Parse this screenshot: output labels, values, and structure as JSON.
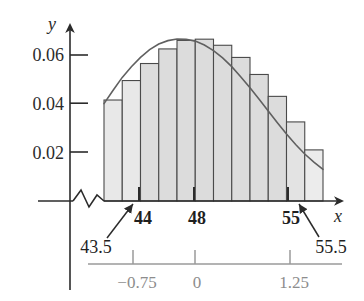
{
  "chart_data": {
    "type": "bar",
    "title": "",
    "xlabel": "x",
    "ylabel": "y",
    "grid": false,
    "legend": "none",
    "axis_break": true,
    "y_axis": {
      "ticks": [
        0.02,
        0.04,
        0.06
      ],
      "tick_labels": [
        "0.02",
        "0.04",
        "0.06"
      ],
      "ylim": [
        0,
        0.072
      ],
      "name": "y"
    },
    "x_axis": {
      "name": "x",
      "ticks": [
        44,
        48,
        55
      ],
      "tick_labels": [
        "44",
        "48",
        "55"
      ],
      "xlim": [
        43.5,
        55.5
      ],
      "edge_labels": [
        "43.5",
        "55.5"
      ],
      "bin_width": 1
    },
    "secondary_axis": {
      "name": "z",
      "ticks": [
        -0.75,
        0,
        1.25
      ],
      "tick_labels": [
        "−0.75",
        "0",
        "1.25"
      ],
      "color": "#9a9a9a"
    },
    "categories": [
      "43.5-44.5",
      "44.5-45.5",
      "45.5-46.5",
      "46.5-47.5",
      "47.5-48.5",
      "48.5-49.5",
      "49.5-50.5",
      "50.5-51.5",
      "51.5-52.5",
      "52.5-53.5",
      "53.5-54.5",
      "54.5-55.5"
    ],
    "bin_left_edges": [
      43.5,
      44.5,
      45.5,
      46.5,
      47.5,
      48.5,
      49.5,
      50.5,
      51.5,
      52.5,
      53.5,
      54.5
    ],
    "values": [
      0.0415,
      0.0495,
      0.0565,
      0.0625,
      0.066,
      0.0665,
      0.064,
      0.059,
      0.052,
      0.043,
      0.0325,
      0.021
    ],
    "series": [
      {
        "name": "histogram",
        "values": [
          0.0415,
          0.0495,
          0.0565,
          0.0625,
          0.066,
          0.0665,
          0.064,
          0.059,
          0.052,
          0.043,
          0.0325,
          0.021
        ]
      },
      {
        "name": "normal-density-curve",
        "type": "line",
        "x": [
          43.5,
          44.0,
          44.5,
          45.0,
          45.5,
          46.0,
          46.5,
          47.0,
          47.5,
          48.0,
          48.5,
          49.0,
          49.5,
          50.0,
          50.5,
          51.0,
          51.5,
          52.0,
          52.5,
          53.0,
          53.5,
          54.0,
          54.5,
          55.0,
          55.5
        ],
        "y": [
          0.04,
          0.0455,
          0.0508,
          0.0552,
          0.059,
          0.0622,
          0.0645,
          0.0659,
          0.0666,
          0.0665,
          0.0657,
          0.0641,
          0.0618,
          0.0588,
          0.0552,
          0.051,
          0.0465,
          0.0418,
          0.037,
          0.0322,
          0.0275,
          0.0232,
          0.0193,
          0.016,
          0.013
        ]
      }
    ],
    "colors": {
      "bar_fill": "#d9d9d9",
      "bar_fill_light": "#e6e6e6",
      "bar_stroke": "#4a4a4a",
      "curve": "#555555",
      "axis": "#2b2b2b",
      "secondary_axis": "#9a9a9a"
    }
  },
  "labels": {
    "y_axis_name": "y",
    "x_axis_name": "x",
    "y_tick_006": "0.06",
    "y_tick_004": "0.04",
    "y_tick_002": "0.02",
    "x_tick_44": "44",
    "x_tick_48": "48",
    "x_tick_55": "55",
    "left_edge": "43.5",
    "right_edge": "55.5",
    "z_tick_neg075": "−0.75",
    "z_tick_0": "0",
    "z_tick_125": "1.25"
  }
}
